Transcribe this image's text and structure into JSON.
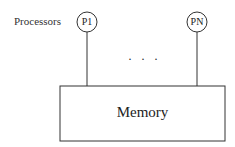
{
  "diagram": {
    "processors_label": "Processors",
    "processors": [
      {
        "label": "P1"
      },
      {
        "label": "PN"
      }
    ],
    "ellipsis": "· · ·",
    "memory_label": "Memory"
  }
}
